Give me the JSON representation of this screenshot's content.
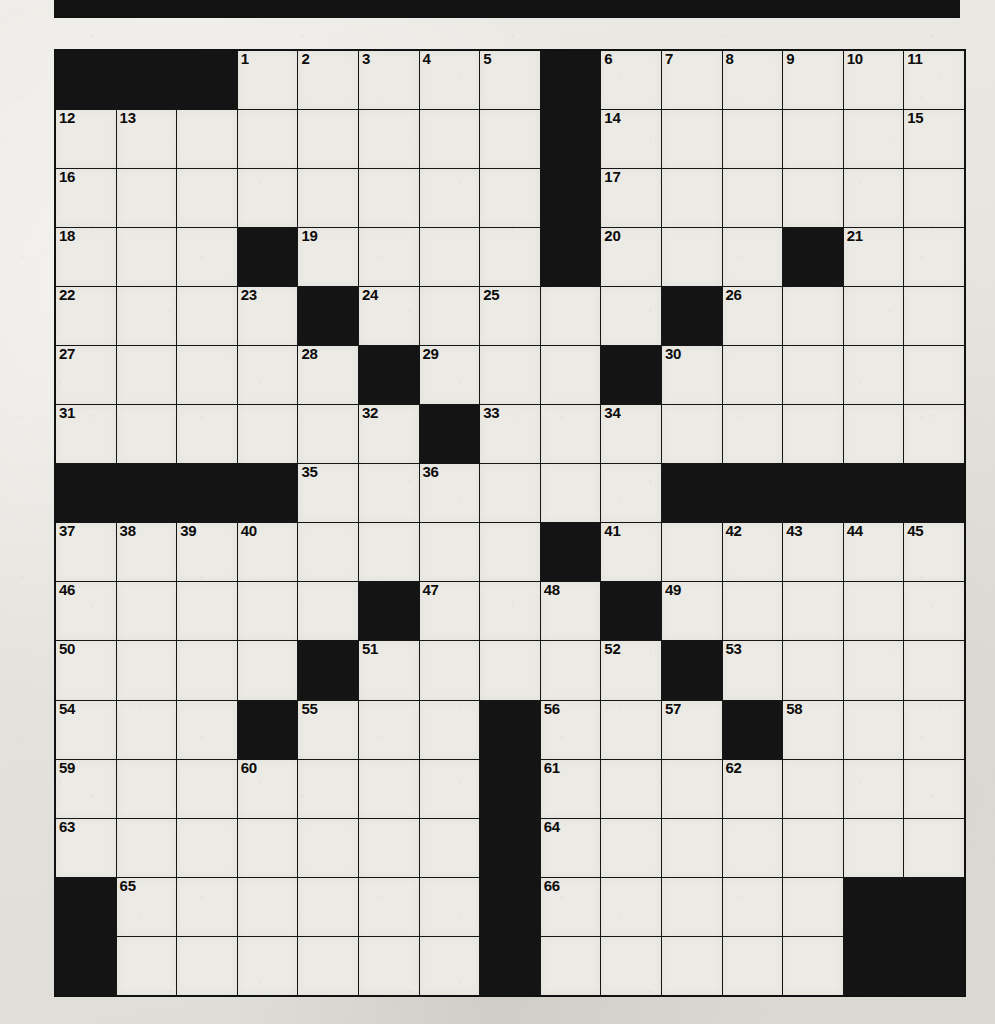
{
  "page": {
    "kind": "crossword-puzzle-grid",
    "banner_color": "#121212",
    "paper_color": "#e8e7e2",
    "cell_fill_color": "#eceae4",
    "block_color": "#141414",
    "grid_line_color": "#161616"
  },
  "grid": {
    "columns": 15,
    "rows": 16,
    "highest_clue_number": 66,
    "rows_data": [
      {
        "index": 0,
        "cells": [
          {
            "block": true,
            "num": ""
          },
          {
            "block": true,
            "num": ""
          },
          {
            "block": true,
            "num": ""
          },
          {
            "block": false,
            "num": "1"
          },
          {
            "block": false,
            "num": "2"
          },
          {
            "block": false,
            "num": "3"
          },
          {
            "block": false,
            "num": "4"
          },
          {
            "block": false,
            "num": "5"
          },
          {
            "block": true,
            "num": ""
          },
          {
            "block": false,
            "num": "6"
          },
          {
            "block": false,
            "num": "7"
          },
          {
            "block": false,
            "num": "8"
          },
          {
            "block": false,
            "num": "9"
          },
          {
            "block": false,
            "num": "10"
          },
          {
            "block": false,
            "num": "11"
          }
        ]
      },
      {
        "index": 1,
        "cells": [
          {
            "block": false,
            "num": "12"
          },
          {
            "block": false,
            "num": "13"
          },
          {
            "block": false,
            "num": ""
          },
          {
            "block": false,
            "num": ""
          },
          {
            "block": false,
            "num": ""
          },
          {
            "block": false,
            "num": ""
          },
          {
            "block": false,
            "num": ""
          },
          {
            "block": false,
            "num": ""
          },
          {
            "block": true,
            "num": ""
          },
          {
            "block": false,
            "num": "14"
          },
          {
            "block": false,
            "num": ""
          },
          {
            "block": false,
            "num": ""
          },
          {
            "block": false,
            "num": ""
          },
          {
            "block": false,
            "num": ""
          },
          {
            "block": false,
            "num": "15"
          }
        ]
      },
      {
        "index": 2,
        "cells": [
          {
            "block": false,
            "num": "16"
          },
          {
            "block": false,
            "num": ""
          },
          {
            "block": false,
            "num": ""
          },
          {
            "block": false,
            "num": ""
          },
          {
            "block": false,
            "num": ""
          },
          {
            "block": false,
            "num": ""
          },
          {
            "block": false,
            "num": ""
          },
          {
            "block": false,
            "num": ""
          },
          {
            "block": true,
            "num": ""
          },
          {
            "block": false,
            "num": "17"
          },
          {
            "block": false,
            "num": ""
          },
          {
            "block": false,
            "num": ""
          },
          {
            "block": false,
            "num": ""
          },
          {
            "block": false,
            "num": ""
          },
          {
            "block": false,
            "num": ""
          }
        ]
      },
      {
        "index": 3,
        "cells": [
          {
            "block": false,
            "num": "18"
          },
          {
            "block": false,
            "num": ""
          },
          {
            "block": false,
            "num": ""
          },
          {
            "block": true,
            "num": ""
          },
          {
            "block": false,
            "num": "19"
          },
          {
            "block": false,
            "num": ""
          },
          {
            "block": false,
            "num": ""
          },
          {
            "block": false,
            "num": ""
          },
          {
            "block": true,
            "num": ""
          },
          {
            "block": false,
            "num": "20"
          },
          {
            "block": false,
            "num": ""
          },
          {
            "block": false,
            "num": ""
          },
          {
            "block": true,
            "num": ""
          },
          {
            "block": false,
            "num": "21"
          },
          {
            "block": false,
            "num": ""
          }
        ]
      },
      {
        "index": 4,
        "cells": [
          {
            "block": false,
            "num": "22"
          },
          {
            "block": false,
            "num": ""
          },
          {
            "block": false,
            "num": ""
          },
          {
            "block": false,
            "num": "23"
          },
          {
            "block": true,
            "num": ""
          },
          {
            "block": false,
            "num": "24"
          },
          {
            "block": false,
            "num": ""
          },
          {
            "block": false,
            "num": "25"
          },
          {
            "block": false,
            "num": ""
          },
          {
            "block": false,
            "num": ""
          },
          {
            "block": true,
            "num": ""
          },
          {
            "block": false,
            "num": "26"
          },
          {
            "block": false,
            "num": ""
          },
          {
            "block": false,
            "num": ""
          },
          {
            "block": false,
            "num": ""
          }
        ]
      },
      {
        "index": 5,
        "cells": [
          {
            "block": false,
            "num": "27"
          },
          {
            "block": false,
            "num": ""
          },
          {
            "block": false,
            "num": ""
          },
          {
            "block": false,
            "num": ""
          },
          {
            "block": false,
            "num": "28"
          },
          {
            "block": true,
            "num": ""
          },
          {
            "block": false,
            "num": "29"
          },
          {
            "block": false,
            "num": ""
          },
          {
            "block": false,
            "num": ""
          },
          {
            "block": true,
            "num": ""
          },
          {
            "block": false,
            "num": "30"
          },
          {
            "block": false,
            "num": ""
          },
          {
            "block": false,
            "num": ""
          },
          {
            "block": false,
            "num": ""
          },
          {
            "block": false,
            "num": ""
          }
        ]
      },
      {
        "index": 6,
        "cells": [
          {
            "block": false,
            "num": "31"
          },
          {
            "block": false,
            "num": ""
          },
          {
            "block": false,
            "num": ""
          },
          {
            "block": false,
            "num": ""
          },
          {
            "block": false,
            "num": ""
          },
          {
            "block": false,
            "num": "32"
          },
          {
            "block": true,
            "num": ""
          },
          {
            "block": false,
            "num": "33"
          },
          {
            "block": false,
            "num": ""
          },
          {
            "block": false,
            "num": "34"
          },
          {
            "block": false,
            "num": ""
          },
          {
            "block": false,
            "num": ""
          },
          {
            "block": false,
            "num": ""
          },
          {
            "block": false,
            "num": ""
          },
          {
            "block": false,
            "num": ""
          }
        ]
      },
      {
        "index": 7,
        "cells": [
          {
            "block": true,
            "num": ""
          },
          {
            "block": true,
            "num": ""
          },
          {
            "block": true,
            "num": ""
          },
          {
            "block": true,
            "num": ""
          },
          {
            "block": false,
            "num": "35"
          },
          {
            "block": false,
            "num": ""
          },
          {
            "block": false,
            "num": "36"
          },
          {
            "block": false,
            "num": ""
          },
          {
            "block": false,
            "num": ""
          },
          {
            "block": false,
            "num": ""
          },
          {
            "block": true,
            "num": ""
          },
          {
            "block": true,
            "num": ""
          },
          {
            "block": true,
            "num": ""
          },
          {
            "block": true,
            "num": ""
          },
          {
            "block": true,
            "num": ""
          }
        ]
      },
      {
        "index": 8,
        "cells": [
          {
            "block": false,
            "num": "37"
          },
          {
            "block": false,
            "num": "38"
          },
          {
            "block": false,
            "num": "39"
          },
          {
            "block": false,
            "num": "40"
          },
          {
            "block": false,
            "num": ""
          },
          {
            "block": false,
            "num": ""
          },
          {
            "block": false,
            "num": ""
          },
          {
            "block": false,
            "num": ""
          },
          {
            "block": true,
            "num": ""
          },
          {
            "block": false,
            "num": "41"
          },
          {
            "block": false,
            "num": ""
          },
          {
            "block": false,
            "num": "42"
          },
          {
            "block": false,
            "num": "43"
          },
          {
            "block": false,
            "num": "44"
          },
          {
            "block": false,
            "num": "45"
          }
        ]
      },
      {
        "index": 9,
        "cells": [
          {
            "block": false,
            "num": "46"
          },
          {
            "block": false,
            "num": ""
          },
          {
            "block": false,
            "num": ""
          },
          {
            "block": false,
            "num": ""
          },
          {
            "block": false,
            "num": ""
          },
          {
            "block": true,
            "num": ""
          },
          {
            "block": false,
            "num": "47"
          },
          {
            "block": false,
            "num": ""
          },
          {
            "block": false,
            "num": "48"
          },
          {
            "block": true,
            "num": ""
          },
          {
            "block": false,
            "num": "49"
          },
          {
            "block": false,
            "num": ""
          },
          {
            "block": false,
            "num": ""
          },
          {
            "block": false,
            "num": ""
          },
          {
            "block": false,
            "num": ""
          }
        ]
      },
      {
        "index": 10,
        "cells": [
          {
            "block": false,
            "num": "50"
          },
          {
            "block": false,
            "num": ""
          },
          {
            "block": false,
            "num": ""
          },
          {
            "block": false,
            "num": ""
          },
          {
            "block": true,
            "num": ""
          },
          {
            "block": false,
            "num": "51"
          },
          {
            "block": false,
            "num": ""
          },
          {
            "block": false,
            "num": ""
          },
          {
            "block": false,
            "num": ""
          },
          {
            "block": false,
            "num": "52"
          },
          {
            "block": true,
            "num": ""
          },
          {
            "block": false,
            "num": "53"
          },
          {
            "block": false,
            "num": ""
          },
          {
            "block": false,
            "num": ""
          },
          {
            "block": false,
            "num": ""
          }
        ]
      },
      {
        "index": 11,
        "cells": [
          {
            "block": false,
            "num": "54"
          },
          {
            "block": false,
            "num": ""
          },
          {
            "block": false,
            "num": ""
          },
          {
            "block": true,
            "num": ""
          },
          {
            "block": false,
            "num": "55"
          },
          {
            "block": false,
            "num": ""
          },
          {
            "block": false,
            "num": ""
          },
          {
            "block": true,
            "num": ""
          },
          {
            "block": false,
            "num": "56"
          },
          {
            "block": false,
            "num": ""
          },
          {
            "block": false,
            "num": "57"
          },
          {
            "block": true,
            "num": ""
          },
          {
            "block": false,
            "num": "58"
          },
          {
            "block": false,
            "num": ""
          },
          {
            "block": false,
            "num": ""
          }
        ]
      },
      {
        "index": 12,
        "cells": [
          {
            "block": false,
            "num": "59"
          },
          {
            "block": false,
            "num": ""
          },
          {
            "block": false,
            "num": ""
          },
          {
            "block": false,
            "num": "60"
          },
          {
            "block": false,
            "num": ""
          },
          {
            "block": false,
            "num": ""
          },
          {
            "block": false,
            "num": ""
          },
          {
            "block": true,
            "num": ""
          },
          {
            "block": false,
            "num": "61"
          },
          {
            "block": false,
            "num": ""
          },
          {
            "block": false,
            "num": ""
          },
          {
            "block": false,
            "num": "62"
          },
          {
            "block": false,
            "num": ""
          },
          {
            "block": false,
            "num": ""
          },
          {
            "block": false,
            "num": ""
          }
        ]
      },
      {
        "index": 13,
        "cells": [
          {
            "block": false,
            "num": "63"
          },
          {
            "block": false,
            "num": ""
          },
          {
            "block": false,
            "num": ""
          },
          {
            "block": false,
            "num": ""
          },
          {
            "block": false,
            "num": ""
          },
          {
            "block": false,
            "num": ""
          },
          {
            "block": false,
            "num": ""
          },
          {
            "block": true,
            "num": ""
          },
          {
            "block": false,
            "num": "64"
          },
          {
            "block": false,
            "num": ""
          },
          {
            "block": false,
            "num": ""
          },
          {
            "block": false,
            "num": ""
          },
          {
            "block": false,
            "num": ""
          },
          {
            "block": false,
            "num": ""
          },
          {
            "block": false,
            "num": ""
          }
        ]
      },
      {
        "index": 14,
        "cells": [
          {
            "block": true,
            "num": ""
          },
          {
            "block": false,
            "num": "65"
          },
          {
            "block": false,
            "num": ""
          },
          {
            "block": false,
            "num": ""
          },
          {
            "block": false,
            "num": ""
          },
          {
            "block": false,
            "num": ""
          },
          {
            "block": false,
            "num": ""
          },
          {
            "block": true,
            "num": ""
          },
          {
            "block": false,
            "num": "66"
          },
          {
            "block": false,
            "num": ""
          },
          {
            "block": false,
            "num": ""
          },
          {
            "block": false,
            "num": ""
          },
          {
            "block": false,
            "num": ""
          },
          {
            "block": true,
            "num": ""
          },
          {
            "block": true,
            "num": ""
          }
        ]
      },
      {
        "index": 15,
        "cells": [
          {
            "block": true,
            "num": ""
          },
          {
            "block": false,
            "num": ""
          },
          {
            "block": false,
            "num": ""
          },
          {
            "block": false,
            "num": ""
          },
          {
            "block": false,
            "num": ""
          },
          {
            "block": false,
            "num": ""
          },
          {
            "block": false,
            "num": ""
          },
          {
            "block": true,
            "num": ""
          },
          {
            "block": false,
            "num": ""
          },
          {
            "block": false,
            "num": ""
          },
          {
            "block": false,
            "num": ""
          },
          {
            "block": false,
            "num": ""
          },
          {
            "block": false,
            "num": ""
          },
          {
            "block": true,
            "num": ""
          },
          {
            "block": true,
            "num": ""
          }
        ]
      }
    ]
  }
}
